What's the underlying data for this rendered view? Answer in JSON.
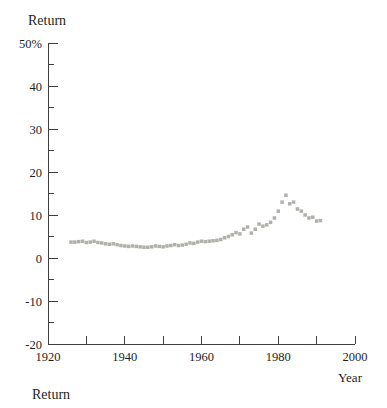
{
  "labels": {
    "y_axis_title": "Return",
    "x_axis_title": "Year",
    "bottom_caption": "Return"
  },
  "colors": {
    "background": "#ffffff",
    "axis": "#3f3f3f",
    "text": "#1e1e1e",
    "marker": "#b1b1ac"
  },
  "chart_data": {
    "type": "scatter",
    "title": "Return",
    "xlabel": "Year",
    "ylabel": "Return",
    "xlim": [
      1920,
      2000
    ],
    "ylim": [
      -20,
      50
    ],
    "grid": false,
    "legend": "none",
    "marker": {
      "shape": "square",
      "color": "#b1b1ac",
      "size_px": 3.5
    },
    "x_major_ticks": [
      {
        "value": 1920,
        "label": "1920"
      },
      {
        "value": 1940,
        "label": "1940"
      },
      {
        "value": 1960,
        "label": "1960"
      },
      {
        "value": 1980,
        "label": "1980"
      },
      {
        "value": 2000,
        "label": "2000"
      }
    ],
    "x_minor_ticks": [
      1930,
      1950,
      1970,
      1990
    ],
    "y_major_ticks": [
      {
        "value": 50,
        "label": "50%"
      },
      {
        "value": 40,
        "label": "40"
      },
      {
        "value": 30,
        "label": "30"
      },
      {
        "value": 20,
        "label": "20"
      },
      {
        "value": 10,
        "label": "10"
      },
      {
        "value": 0,
        "label": "0"
      },
      {
        "value": -10,
        "label": "-10"
      },
      {
        "value": -20,
        "label": "-20"
      }
    ],
    "y_minor_ticks": [
      45,
      35,
      25,
      15,
      5,
      -5,
      -15
    ],
    "series": [
      {
        "name": "Return",
        "x": [
          1926,
          1927,
          1928,
          1929,
          1930,
          1931,
          1932,
          1933,
          1934,
          1935,
          1936,
          1937,
          1938,
          1939,
          1940,
          1941,
          1942,
          1943,
          1944,
          1945,
          1946,
          1947,
          1948,
          1949,
          1950,
          1951,
          1952,
          1953,
          1954,
          1955,
          1956,
          1957,
          1958,
          1959,
          1960,
          1961,
          1962,
          1963,
          1964,
          1965,
          1966,
          1967,
          1968,
          1969,
          1970,
          1971,
          1972,
          1973,
          1974,
          1975,
          1976,
          1977,
          1978,
          1979,
          1980,
          1981,
          1982,
          1983,
          1984,
          1985,
          1986,
          1987,
          1988,
          1989,
          1990,
          1991
        ],
        "y": [
          3.7,
          3.7,
          3.8,
          3.9,
          3.6,
          3.7,
          3.9,
          3.6,
          3.5,
          3.3,
          3.2,
          3.3,
          3.1,
          2.9,
          2.8,
          2.7,
          2.8,
          2.7,
          2.6,
          2.5,
          2.5,
          2.6,
          2.8,
          2.7,
          2.6,
          2.8,
          2.9,
          3.1,
          2.9,
          3.0,
          3.2,
          3.5,
          3.4,
          3.7,
          3.9,
          3.8,
          3.9,
          4.0,
          4.1,
          4.3,
          4.7,
          5.0,
          5.4,
          5.9,
          5.6,
          6.7,
          7.2,
          5.8,
          6.7,
          7.9,
          7.4,
          7.7,
          8.3,
          9.3,
          10.9,
          13.0,
          14.6,
          12.6,
          13.0,
          11.4,
          10.9,
          10.0,
          9.3,
          9.5,
          8.6,
          8.7
        ]
      }
    ]
  }
}
